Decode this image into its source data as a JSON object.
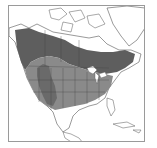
{
  "map": {
    "subject": "North America species range map",
    "colors": {
      "background": "#ffffff",
      "land_outline": "#555555",
      "range_dark": "#5e5e5e",
      "range_medium": "#8a8a8a",
      "range_west": "#6a6a6a",
      "water_lakes": "#ffffff",
      "frame": "#9a9a9a"
    },
    "regions": [
      {
        "name": "northern-boreal-range",
        "shade": "dark"
      },
      {
        "name": "central-us-range",
        "shade": "medium"
      },
      {
        "name": "western-mountain-range",
        "shade": "dark"
      }
    ]
  }
}
